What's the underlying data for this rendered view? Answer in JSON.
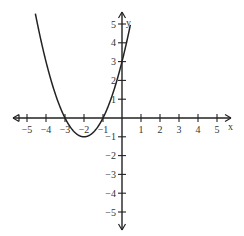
{
  "chart_data": {
    "type": "line",
    "title": "",
    "function": "y = x^2 + 4x + 3",
    "xlabel": "x",
    "ylabel": "y",
    "xlim": [
      -5.5,
      5.5
    ],
    "ylim": [
      -5.5,
      5.5
    ],
    "grid": false,
    "x_ticks": [
      -5,
      -4,
      -3,
      -2,
      -1,
      1,
      2,
      3,
      4,
      5
    ],
    "y_ticks": [
      -5,
      -4,
      -3,
      -2,
      -1,
      1,
      2,
      3,
      4,
      5
    ],
    "series": [
      {
        "name": "parabola",
        "x": [
          -5.4,
          -5,
          -4.5,
          -4,
          -3.5,
          -3,
          -2.5,
          -2,
          -1.5,
          -1,
          -0.5,
          0,
          0.4
        ],
        "y": [
          5.56,
          8,
          4.25,
          3,
          1.25,
          0,
          -0.75,
          -1,
          -0.75,
          0,
          1.25,
          3,
          4.76
        ]
      }
    ],
    "key_points": {
      "vertex": [
        -2,
        -1
      ],
      "x_intercepts": [
        -3,
        -1
      ],
      "y_intercept": 3
    }
  }
}
